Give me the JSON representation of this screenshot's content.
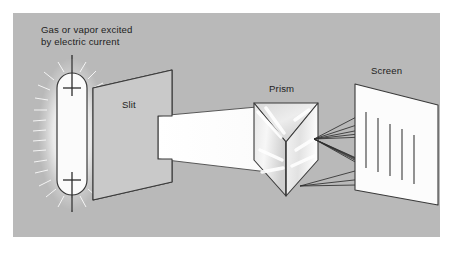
{
  "figure": {
    "kind": "spectroscope-diagram",
    "title_visible": false,
    "background": {
      "outer": "#ffffff",
      "panel": "#b9b9b9",
      "panel_rect": [
        13,
        13,
        427,
        224
      ]
    },
    "palette": {
      "ink": "#1d1d1d",
      "stroke": "#3a3a3a",
      "panel_gray": "#b9b9b9",
      "slit_face": "#c9c9c9",
      "slit_edge": "#d6d6d6",
      "beam_white": "#fefefe",
      "prism_light": "#e8e8e8",
      "prism_mid": "#d2d2d2",
      "prism_dark": "#c0c0c0",
      "screen_white": "#fcfcfc",
      "tube_white": "#fbfbfb",
      "glow": "#f2f2f2",
      "ray_line": "#2e2e2e"
    }
  },
  "labels": {
    "source": "Gas or vapor excited\nby electric current",
    "slit": "Slit",
    "prism": "Prism",
    "screen": "Screen"
  },
  "components": {
    "discharge_tube": {
      "name": "gas-discharge-tube",
      "shape": "vertical rounded capsule",
      "rect": [
        57,
        73,
        30,
        122
      ],
      "corner_radius": 15,
      "fill": "#fbfbfb",
      "glow": "radial spikes around tube",
      "electrodes": [
        {
          "position": "top",
          "bar_y": 88,
          "lead_top": 55
        },
        {
          "position": "bottom",
          "bar_y": 180,
          "lead_bottom": 212
        }
      ]
    },
    "slit_panel": {
      "name": "slit-panel",
      "shape": "parallelogram in perspective",
      "points": "93,88 172,70 172,182 93,200",
      "fill": "#c9c9c9",
      "aperture": {
        "name": "slit-aperture",
        "y_range": [
          116,
          158
        ]
      }
    },
    "light_beam": {
      "name": "collimated-light-beam",
      "points": "158,115 262,107 262,170 158,160",
      "fill": "#fefefe",
      "description": "white beam from slit to prism"
    },
    "prism": {
      "name": "triangular-prism",
      "shape": "triangular prism seen from above",
      "top_face": "254,103 318,103 286,142",
      "front_left": "254,103 286,142 286,196 254,160",
      "front_right": "318,103 286,142 286,196 318,160",
      "apex_x": 286,
      "fill_light": "#e8e8e8",
      "fill_mid": "#d2d2d2",
      "fill_dark": "#c0c0c0"
    },
    "screen": {
      "name": "projection-screen",
      "shape": "parallelogram in perspective",
      "points": "355,84 438,105 438,205 355,190",
      "fill": "#fcfcfc",
      "spectral_lines_count": 5
    },
    "dispersed_rays": {
      "name": "dispersed-light-rays",
      "origin": [
        314,
        140
      ],
      "line_color": "#2e2e2e",
      "ray_count": 10,
      "description": "thin rays fanning from prism to spectral lines on screen"
    },
    "spectral_lines": {
      "name": "spectral-lines",
      "count": 5,
      "orientation": "vertical",
      "color": "#3a3a3a"
    }
  }
}
